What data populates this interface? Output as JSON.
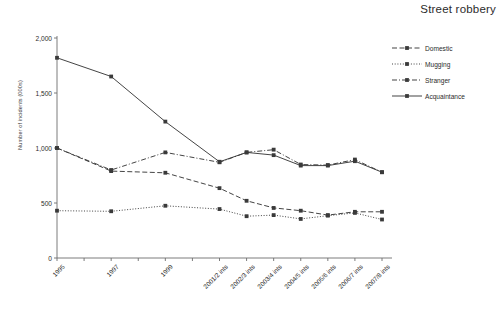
{
  "chart_data": {
    "type": "line",
    "title": "Street robbery",
    "xlabel": "",
    "ylabel": "Number of incidents (000s)",
    "ylim": [
      0,
      2000
    ],
    "yticks": [
      "0",
      "500",
      "1,000",
      "1,500",
      "2,000"
    ],
    "ytick_values": [
      0,
      500,
      1000,
      1500,
      2000
    ],
    "grid": false,
    "legend_position": "right",
    "categories": [
      "1995",
      "",
      "1997",
      "",
      "1999",
      "",
      "2001/2 ints",
      "2002/3 ints",
      "2003/4 ints",
      "2004/5 ints",
      "2005/6 ints",
      "2006/7 ints",
      "2007/8 ints"
    ],
    "tick_labels_visible": [
      "1995",
      "1997",
      "1999",
      "2001/2 ints",
      "2002/3 ints",
      "2003/4 ints",
      "2004/5 ints",
      "2005/6 ints",
      "2006/7 ints",
      "2007/8 ints"
    ],
    "series": [
      {
        "name": "Domestic",
        "style": "dashed",
        "color": "#3a3a3a",
        "x": [
          "1995",
          "1997",
          "1999",
          "2001/2 ints",
          "2002/3 ints",
          "2003/4 ints",
          "2004/5 ints",
          "2005/6 ints",
          "2006/7 ints",
          "2007/8 ints"
        ],
        "values": [
          1000,
          790,
          775,
          635,
          520,
          455,
          430,
          390,
          420,
          420
        ]
      },
      {
        "name": "Mugging",
        "style": "dotted",
        "color": "#3a3a3a",
        "x": [
          "1995",
          "1997",
          "1999",
          "2001/2 ints",
          "2002/3 ints",
          "2003/4 ints",
          "2004/5 ints",
          "2005/6 ints",
          "2006/7 ints",
          "2007/8 ints"
        ],
        "values": [
          430,
          425,
          475,
          445,
          380,
          390,
          355,
          385,
          410,
          350
        ]
      },
      {
        "name": "Stranger",
        "style": "dashdot",
        "color": "#3a3a3a",
        "x": [
          "1995",
          "1997",
          "1999",
          "2001/2 ints",
          "2002/3 ints",
          "2003/4 ints",
          "2004/5 ints",
          "2005/6 ints",
          "2006/7 ints",
          "2007/8 ints"
        ],
        "values": [
          1000,
          800,
          960,
          870,
          960,
          985,
          850,
          845,
          895,
          780
        ]
      },
      {
        "name": "Acquaintance",
        "style": "solid",
        "color": "#3a3a3a",
        "x": [
          "1995",
          "1997",
          "1999",
          "2001/2 ints",
          "2002/3 ints",
          "2003/4 ints",
          "2004/5 ints",
          "2005/6 ints",
          "2006/7 ints",
          "2007/8 ints"
        ],
        "values": [
          1820,
          1650,
          1240,
          875,
          960,
          935,
          840,
          840,
          880,
          780
        ]
      }
    ]
  }
}
